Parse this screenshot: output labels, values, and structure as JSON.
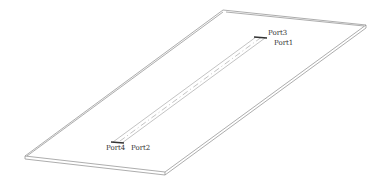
{
  "diagram": {
    "type": "isometric-pcb-model",
    "ports": [
      {
        "id": "port1",
        "label": "Port1"
      },
      {
        "id": "port2",
        "label": "Port2"
      },
      {
        "id": "port3",
        "label": "Port3"
      },
      {
        "id": "port4",
        "label": "Port4"
      }
    ],
    "colors": {
      "edge": "#8a8a8a",
      "port": "#333333",
      "background": "#ffffff"
    }
  }
}
